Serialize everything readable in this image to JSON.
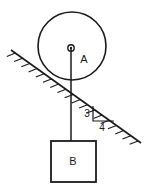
{
  "figure": {
    "type": "physics-free-body-diagram",
    "background_color": "#ffffff",
    "stroke_color": "#1a1a1a",
    "labels": {
      "pulley_label": "A",
      "block_label": "B",
      "slope_rise_label": "3",
      "slope_run_label": "4"
    },
    "elements": {
      "pulley": {
        "name": "circular-pulley-A",
        "center_x": 72,
        "center_y": 46,
        "radius": 34,
        "stroke_width": 1.6,
        "center_dot_outer_radius": 3.2,
        "center_dot_inner_radius": 1.2
      },
      "incline": {
        "name": "inclined-surface",
        "x1": 11,
        "y1": 50,
        "x2": 141,
        "y2": 143,
        "stroke_width": 1.6,
        "hatch_count": 18,
        "hatch_length": 9
      },
      "rope": {
        "name": "vertical-rope",
        "x": 71,
        "y1": 48,
        "y2": 141,
        "stroke_width": 1.5
      },
      "block": {
        "name": "hanging-block-B",
        "x": 51,
        "y": 141,
        "width": 45,
        "height": 41,
        "stroke_width": 1.8
      },
      "slope_triangle": {
        "name": "slope-ratio-triangle",
        "apex_x": 93,
        "apex_y": 106,
        "corner_x": 93,
        "corner_y": 121,
        "end_x": 114,
        "end_y": 121,
        "stroke_width": 1.2
      }
    },
    "label_positions": {
      "pulley_label_x": 84,
      "pulley_label_y": 60,
      "block_label_x": 73,
      "block_label_y": 162,
      "slope_rise_x": 87,
      "slope_rise_y": 114,
      "slope_run_x": 102,
      "slope_run_y": 128
    }
  },
  "chart_data": {
    "type": "diagram",
    "title": "",
    "annotations": [
      "A",
      "B",
      "3",
      "4"
    ]
  }
}
